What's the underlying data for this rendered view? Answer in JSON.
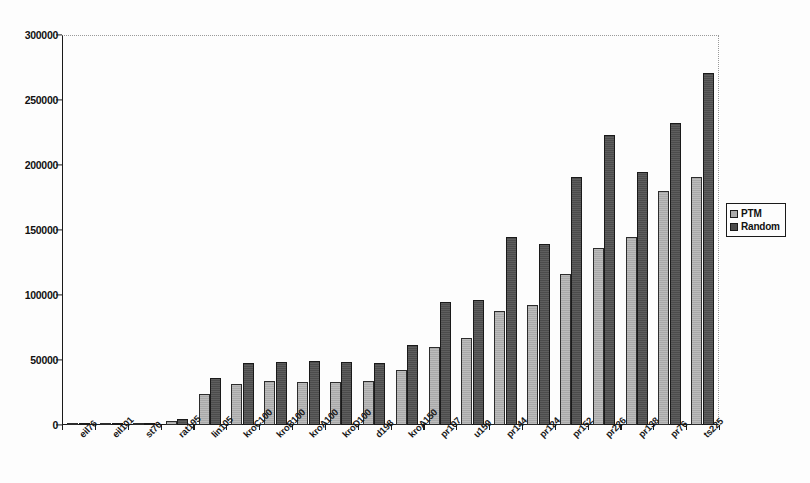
{
  "chart_data": {
    "type": "bar",
    "title": "",
    "subtitle": "",
    "xlabel": "",
    "ylabel": "",
    "ylim": [
      0,
      300000
    ],
    "ytick_step": 50000,
    "yticks": [
      0,
      50000,
      100000,
      150000,
      200000,
      250000,
      300000
    ],
    "ytick_labels": [
      "0",
      "50000",
      "100000",
      "150000",
      "200000",
      "250000",
      "300000"
    ],
    "grid": false,
    "legend_position": "right-outside",
    "categories": [
      "eil76",
      "eil101",
      "st70",
      "rat195",
      "lin105",
      "kroC100",
      "kroB100",
      "kroA100",
      "kroD100",
      "d198",
      "kroA150",
      "pr107",
      "u159",
      "pr144",
      "pr124",
      "pr152",
      "pr226",
      "pr138",
      "pr76",
      "ts225"
    ],
    "series": [
      {
        "name": "PTM",
        "color": "#a9a9a9",
        "values": [
          700,
          900,
          800,
          3200,
          23500,
          31500,
          33500,
          33000,
          33000,
          33500,
          42500,
          60000,
          67000,
          87500,
          92500,
          116500,
          136000,
          144500,
          180000,
          190500
        ]
      },
      {
        "name": "Random",
        "color": "#4c4c4c",
        "values": [
          1100,
          1300,
          1200,
          5000,
          36000,
          48000,
          48500,
          49500,
          48500,
          48000,
          61500,
          94500,
          96500,
          145000,
          139500,
          191000,
          223000,
          195000,
          232000,
          270500
        ]
      }
    ]
  },
  "legend": {
    "items": [
      {
        "label": "PTM",
        "color": "#a9a9a9"
      },
      {
        "label": "Random",
        "color": "#4c4c4c"
      }
    ]
  },
  "axes": {
    "y_max": 300000,
    "y_min": 0
  }
}
